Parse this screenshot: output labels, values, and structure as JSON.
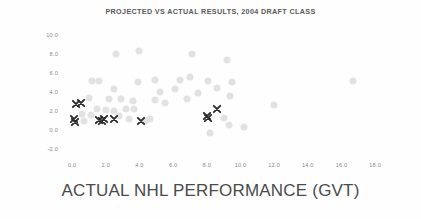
{
  "chart_data": {
    "type": "scatter",
    "title": "PROJECTED VS ACTUAL RESULTS, 2004 DRAFT CLASS",
    "xlabel": "ACTUAL NHL PERFORMANCE (GVT)",
    "ylabel": "PROJECTED NHL PERFORMANCE (GVT)",
    "xlim": [
      -0.6,
      19.0
    ],
    "ylim": [
      -3.0,
      10.8
    ],
    "grid": false,
    "legend": "none",
    "xticks": [
      "0.0",
      "2.0",
      "4.0",
      "6.0",
      "8.0",
      "10.0",
      "12.0",
      "14.0",
      "16.0",
      "18.0"
    ],
    "xtick_values": [
      0.0,
      2.0,
      4.0,
      6.0,
      8.0,
      10.0,
      12.0,
      14.0,
      16.0,
      18.0
    ],
    "yticks": [
      "10.0",
      "8.0",
      "6.0",
      "4.0",
      "2.0",
      "0.0",
      "-2.0"
    ],
    "ytick_values": [
      10.0,
      8.0,
      6.0,
      4.0,
      2.0,
      0.0,
      -2.0
    ],
    "series": [
      {
        "name": "other-prospects",
        "marker": "circle",
        "color": "#e2e2e2",
        "points": [
          [
            2.6,
            8.0
          ],
          [
            4.0,
            8.3
          ],
          [
            7.1,
            8.0
          ],
          [
            9.2,
            7.4
          ],
          [
            16.7,
            5.2
          ],
          [
            1.2,
            5.2
          ],
          [
            1.6,
            5.2
          ],
          [
            3.9,
            5.1
          ],
          [
            4.9,
            5.3
          ],
          [
            6.4,
            5.3
          ],
          [
            7.0,
            5.6
          ],
          [
            8.1,
            5.2
          ],
          [
            9.5,
            5.1
          ],
          [
            2.5,
            4.3
          ],
          [
            5.2,
            4.0
          ],
          [
            6.1,
            4.3
          ],
          [
            7.5,
            3.9
          ],
          [
            8.6,
            4.4
          ],
          [
            9.4,
            3.6
          ],
          [
            1.0,
            3.4
          ],
          [
            2.2,
            3.3
          ],
          [
            2.9,
            3.3
          ],
          [
            3.6,
            3.1
          ],
          [
            4.9,
            3.2
          ],
          [
            5.5,
            2.9
          ],
          [
            6.8,
            3.3
          ],
          [
            12.0,
            2.6
          ],
          [
            1.5,
            2.2
          ],
          [
            2.0,
            2.1
          ],
          [
            2.5,
            2.0
          ],
          [
            3.2,
            2.2
          ],
          [
            3.7,
            2.2
          ],
          [
            0.6,
            1.7
          ],
          [
            1.1,
            1.6
          ],
          [
            2.8,
            1.5
          ],
          [
            3.4,
            1.2
          ],
          [
            4.3,
            1.0
          ],
          [
            4.6,
            1.2
          ],
          [
            9.0,
            1.3
          ],
          [
            0.7,
            1.0
          ],
          [
            9.3,
            0.6
          ],
          [
            8.2,
            -0.3
          ],
          [
            10.2,
            0.3
          ]
        ]
      },
      {
        "name": "highlighted-prospects",
        "marker": "x",
        "color": "#2b2b2b",
        "points": [
          [
            0.25,
            2.8
          ],
          [
            0.55,
            2.9
          ],
          [
            0.1,
            1.2
          ],
          [
            0.15,
            0.9
          ],
          [
            1.6,
            1.1
          ],
          [
            1.75,
            1.0
          ],
          [
            1.9,
            1.2
          ],
          [
            2.5,
            1.2
          ],
          [
            4.1,
            1.0
          ],
          [
            8.0,
            1.5
          ],
          [
            8.05,
            1.3
          ],
          [
            8.6,
            2.2
          ]
        ]
      }
    ]
  }
}
